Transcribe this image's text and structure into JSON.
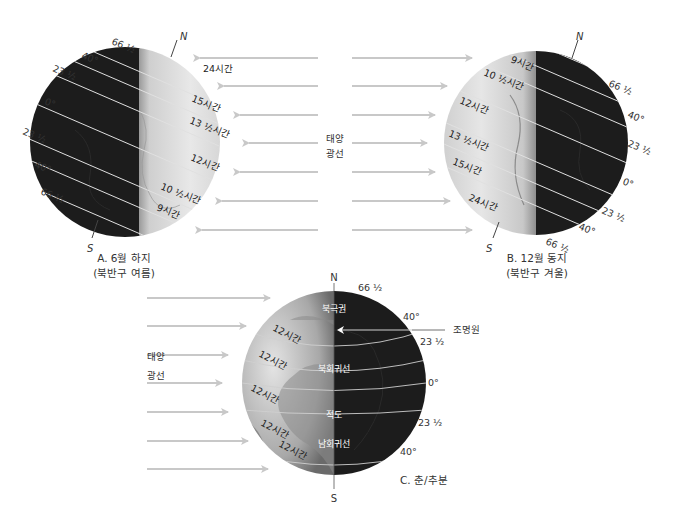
{
  "colors": {
    "arrow": "#c8c8c8",
    "night": "#1c1c1c",
    "day_light": "#e6e6e6",
    "day_mid": "#bdbdbd",
    "parallel_line": "#e0e0e0",
    "text": "#333333"
  },
  "sun_rays_label": {
    "line1": "태양",
    "line2": "광선"
  },
  "diagram_a": {
    "caption_line1": "A. 6월 하지",
    "caption_line2": "(북반구 여름)",
    "north": "N",
    "south": "S",
    "latitudes": [
      "66 ½",
      "40°",
      "23 ½",
      "0°",
      "23 ½",
      "40°",
      "66 ½"
    ],
    "day_lengths": [
      "24시간",
      "15시간",
      "13 ½시간",
      "12시간",
      "10 ½시간",
      "9시간"
    ]
  },
  "diagram_b": {
    "caption_line1": "B. 12월 동지",
    "caption_line2": "(북반구 겨울)",
    "north": "N",
    "south": "S",
    "latitudes": [
      "66 ½",
      "40°",
      "23 ½",
      "0°",
      "23 ½",
      "40°",
      "66 ½"
    ],
    "day_lengths": [
      "9시간",
      "10 ½시간",
      "12시간",
      "13 ½시간",
      "15시간",
      "24시간"
    ]
  },
  "diagram_c": {
    "caption": "C. 춘/추분",
    "north": "N",
    "south": "S",
    "latitudes": [
      "66 ½",
      "40°",
      "23 ½",
      "0°",
      "23 ½",
      "40°"
    ],
    "day_lengths": [
      "12시간",
      "12시간",
      "12시간",
      "12시간",
      "12시간"
    ],
    "zones": [
      "북극권",
      "북회귀선",
      "적도",
      "남회귀선"
    ],
    "terminator_label": "조명원"
  }
}
